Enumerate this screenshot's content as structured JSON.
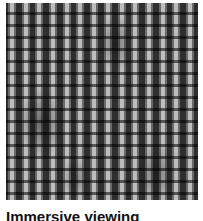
{
  "card": {
    "image_alt": "Abstract grayscale striped pattern",
    "caption": "Immersive viewing"
  },
  "colors": {
    "background": "#ffffff",
    "caption_text": "#111111"
  }
}
